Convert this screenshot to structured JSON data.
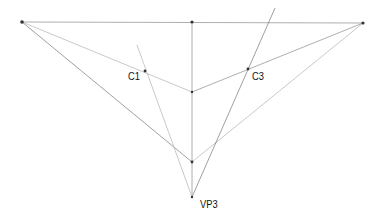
{
  "diagram": {
    "points": {
      "left": [
        22,
        22
      ],
      "top_mid": [
        192,
        22
      ],
      "right": [
        363,
        23
      ],
      "C1": [
        145,
        71
      ],
      "C3": [
        248,
        69
      ],
      "center": [
        192,
        92
      ],
      "lower": [
        192,
        162
      ],
      "VP3": [
        192,
        197
      ]
    },
    "labels": [
      {
        "text": "C1",
        "x": 128,
        "y": 70
      },
      {
        "text": "C3",
        "x": 252,
        "y": 70
      },
      {
        "text": "VP3",
        "x": 200,
        "y": 198
      }
    ]
  }
}
